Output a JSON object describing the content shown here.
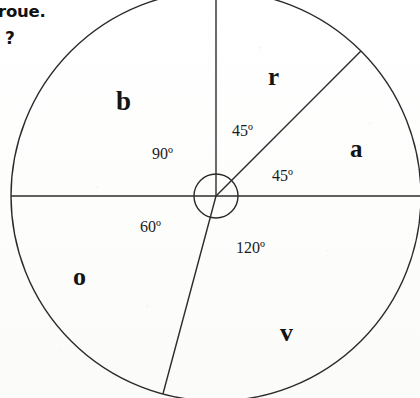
{
  "prompt": {
    "line1": "roue.",
    "line2": "?"
  },
  "wheel": {
    "center_x": 216,
    "center_y": 196,
    "outer_radius": 205,
    "hub_radius": 22,
    "stroke_color": "#2b2b2b",
    "stroke_width": 1.4
  },
  "chart_data": {
    "type": "pie",
    "title": "",
    "subtitle": "",
    "xlabel": "",
    "ylabel": "",
    "legend_position": "none",
    "grid": false,
    "units": "degrees",
    "total_degrees": 360,
    "categories": [
      "b",
      "r",
      "a",
      "v",
      "o"
    ],
    "values": [
      90,
      45,
      45,
      120,
      60
    ],
    "annotations": [
      "90º",
      "45º",
      "45º",
      "120º",
      "60º"
    ],
    "series": [
      {
        "name": "secteurs",
        "values": [
          90,
          45,
          45,
          120,
          60
        ]
      }
    ],
    "slices": [
      {
        "label": "b",
        "angle_deg": 90,
        "angle_text": "90º",
        "start_deg": 90,
        "end_deg": 180,
        "label_x": 116,
        "label_y": 88,
        "label_size": 27,
        "annot_x": 152,
        "annot_y": 146
      },
      {
        "label": "r",
        "angle_deg": 45,
        "angle_text": "45º",
        "start_deg": 45,
        "end_deg": 90,
        "label_x": 268,
        "label_y": 64,
        "label_size": 25,
        "annot_x": 232,
        "annot_y": 123
      },
      {
        "label": "a",
        "angle_deg": 45,
        "angle_text": "45º",
        "start_deg": 0,
        "end_deg": 45,
        "label_x": 350,
        "label_y": 136,
        "label_size": 25,
        "annot_x": 272,
        "annot_y": 168
      },
      {
        "label": "v",
        "angle_deg": 120,
        "angle_text": "120º",
        "start_deg": 255,
        "end_deg": 360,
        "label_x": 280,
        "label_y": 320,
        "label_size": 26,
        "annot_x": 236,
        "annot_y": 240
      },
      {
        "label": "o",
        "angle_deg": 60,
        "angle_text": "60º",
        "start_deg": 180,
        "end_deg": 255,
        "label_x": 73,
        "label_y": 264,
        "label_size": 26,
        "annot_x": 140,
        "annot_y": 219
      }
    ]
  }
}
